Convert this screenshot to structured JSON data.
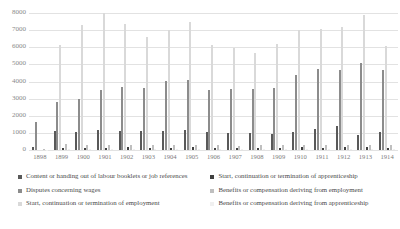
{
  "chart_data": {
    "type": "bar",
    "title": "",
    "xlabel": "",
    "ylabel": "",
    "ylim": [
      0,
      8000
    ],
    "yticks": [
      8000,
      7000,
      6000,
      5000,
      4000,
      3000,
      2000,
      1000,
      0
    ],
    "grid": true,
    "legend_position": "bottom",
    "categories": [
      "1898",
      "1899",
      "1900",
      "1901",
      "1902",
      "1903",
      "1904",
      "1905",
      "1906",
      "1907",
      "1908",
      "1909",
      "1910",
      "1911",
      "1912",
      "1913",
      "1914"
    ],
    "series": [
      {
        "name": "Content or handing out of labour booklets or job references",
        "color": "#595959",
        "values": [
          170,
          1120,
          1040,
          1180,
          1100,
          1110,
          1110,
          1140,
          1040,
          1010,
          1020,
          920,
          1060,
          1250,
          1400,
          900,
          1050
        ]
      },
      {
        "name": "Disputes concerning wages",
        "color": "#8c8c8c",
        "values": [
          1620,
          2780,
          2960,
          3480,
          3700,
          3600,
          4010,
          4090,
          3480,
          3560,
          3560,
          3600,
          4400,
          4750,
          4700,
          5100,
          4680
        ]
      },
      {
        "name": "Start, continuation or termination of employment",
        "color": "#d9d9d9",
        "values": [
          0,
          6120,
          7280,
          7980,
          7380,
          6580,
          6980,
          7480,
          6120,
          5980,
          5680,
          6180,
          6980,
          7080,
          7180,
          7880,
          6080
        ]
      },
      {
        "name": "Start, continuation or termination of apprenticeship",
        "color": "#404040",
        "values": [
          0,
          120,
          130,
          140,
          150,
          130,
          120,
          150,
          130,
          120,
          130,
          140,
          150,
          140,
          160,
          150,
          140
        ]
      },
      {
        "name": "Benefits or compensation deriving from employment",
        "color": "#bfbfbf",
        "values": [
          40,
          340,
          300,
          300,
          280,
          300,
          300,
          300,
          280,
          260,
          300,
          300,
          320,
          300,
          320,
          300,
          300
        ]
      },
      {
        "name": "Benefits or compensation deriving from apprenticeship",
        "color": "#f0f0f0",
        "values": [
          20,
          60,
          60,
          60,
          60,
          60,
          60,
          60,
          60,
          60,
          60,
          60,
          60,
          60,
          60,
          60,
          60
        ]
      }
    ]
  },
  "legend": {
    "column_left": [
      "Content or handing out of labour booklets or job references",
      "Disputes concerning wages",
      "Start, continuation or termination of employment"
    ],
    "column_right": [
      "Start, continuation or termination of apprenticeship",
      "Benefits or compensation deriving from employment",
      "Benefits or compensation deriving from apprenticeship"
    ]
  }
}
